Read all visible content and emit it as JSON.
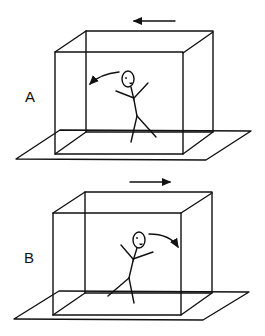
{
  "panels": [
    {
      "label": "A",
      "motion_direction": "left",
      "fall_direction": "backward (left)"
    },
    {
      "label": "B",
      "motion_direction": "right",
      "fall_direction": "forward (right)"
    }
  ],
  "colors": {
    "line": "#111111",
    "background": "#ffffff"
  }
}
